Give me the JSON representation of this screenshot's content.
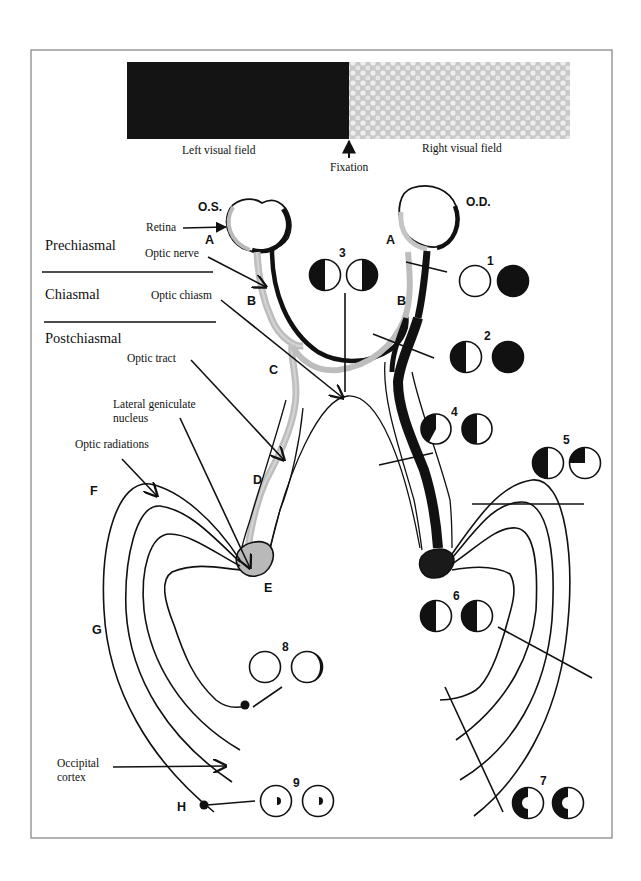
{
  "diagram": {
    "colors": {
      "left_field": "#141414",
      "right_field": "#d7d7d7",
      "nasal_fibers": "#bdbdbd",
      "temporal_fibers": "#111111",
      "lgn_left": "#b9b9b9",
      "lgn_right": "#1a1a1a",
      "frame": "#8a8a8a"
    },
    "visual_field_bar": {
      "left_label": "Left visual field",
      "right_label": "Right visual field",
      "fixation_label": "Fixation"
    },
    "eyes": {
      "left": "O.S.",
      "right": "O.D."
    },
    "sections": {
      "prechiasmal": "Prechiasmal",
      "chiasmal": "Chiasmal",
      "postchiasmal": "Postchiasmal"
    },
    "structures": {
      "retina": "Retina",
      "optic_nerve": "Optic nerve",
      "optic_chiasm": "Optic chiasm",
      "optic_tract": "Optic tract",
      "lgn_line1": "Lateral geniculate",
      "lgn_line2": "nucleus",
      "optic_radiations": "Optic radiations",
      "occipital_line1": "Occipital",
      "occipital_line2": "cortex"
    },
    "segment_letters": {
      "a_left": "A",
      "a_right": "A",
      "b_left": "B",
      "b_right": "B",
      "c": "C",
      "d": "D",
      "e": "E",
      "f": "F",
      "g": "G",
      "h": "H"
    },
    "lesions": [
      {
        "number": "1",
        "site": "Right optic nerve",
        "os_field": "full",
        "od_field": "blind"
      },
      {
        "number": "2",
        "site": "Junction (right optic nerve + chiasm)",
        "os_field": "temporal hemianopia",
        "od_field": "blind"
      },
      {
        "number": "3",
        "site": "Optic chiasm",
        "os_field": "left temporal",
        "od_field": "right temporal"
      },
      {
        "number": "4",
        "site": "Right optic tract",
        "os_field": "incongruous left homonymous",
        "od_field": "left homonymous"
      },
      {
        "number": "5",
        "site": "Right optic radiations (parietal)",
        "os_field": "left homonymous",
        "od_field": "left inferior quadrant"
      },
      {
        "number": "6",
        "site": "Right optic radiations",
        "os_field": "left homonymous hemianopia",
        "od_field": "left homonymous hemianopia"
      },
      {
        "number": "7",
        "site": "Right occipital cortex",
        "os_field": "left homonymous with macular sparing",
        "od_field": "left homonymous with macular sparing"
      },
      {
        "number": "8",
        "site": "Left anterior occipital cortex",
        "os_field": "full",
        "od_field": "temporal crescent"
      },
      {
        "number": "9",
        "site": "Left occipital pole",
        "os_field": "central homonymous scotoma",
        "od_field": "central homonymous scotoma"
      }
    ]
  }
}
